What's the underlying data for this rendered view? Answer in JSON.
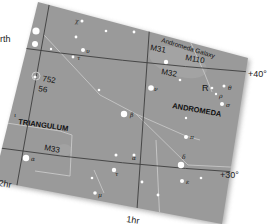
{
  "map": {
    "partial_text_left": "rth",
    "constellations": [
      {
        "name": "ANDROMEDA"
      },
      {
        "name": "TRIANGULUM"
      }
    ],
    "deep_sky_objects": [
      {
        "label": "Andromeda Galaxy"
      },
      {
        "label": "M31"
      },
      {
        "label": "M110"
      },
      {
        "label": "M32"
      },
      {
        "label": "M33"
      },
      {
        "label": "752"
      },
      {
        "label": "56"
      },
      {
        "label": "R"
      }
    ],
    "declination_labels": [
      "+40°",
      "+30°"
    ],
    "ra_labels": [
      "2hr",
      "1hr"
    ],
    "star_greek_labels": [
      "χ",
      "υ",
      "τ",
      "β",
      "θ",
      "ρ",
      "σ",
      "π",
      "δ",
      "ε",
      "α",
      "ι",
      "γ",
      "ν",
      "μ"
    ],
    "colors": {
      "sky_card": "#9a9a9a",
      "grid_line": "#3a3a3a",
      "constellation_line": "#c4c4c4",
      "star": "#ffffff",
      "text": "#111111"
    }
  }
}
